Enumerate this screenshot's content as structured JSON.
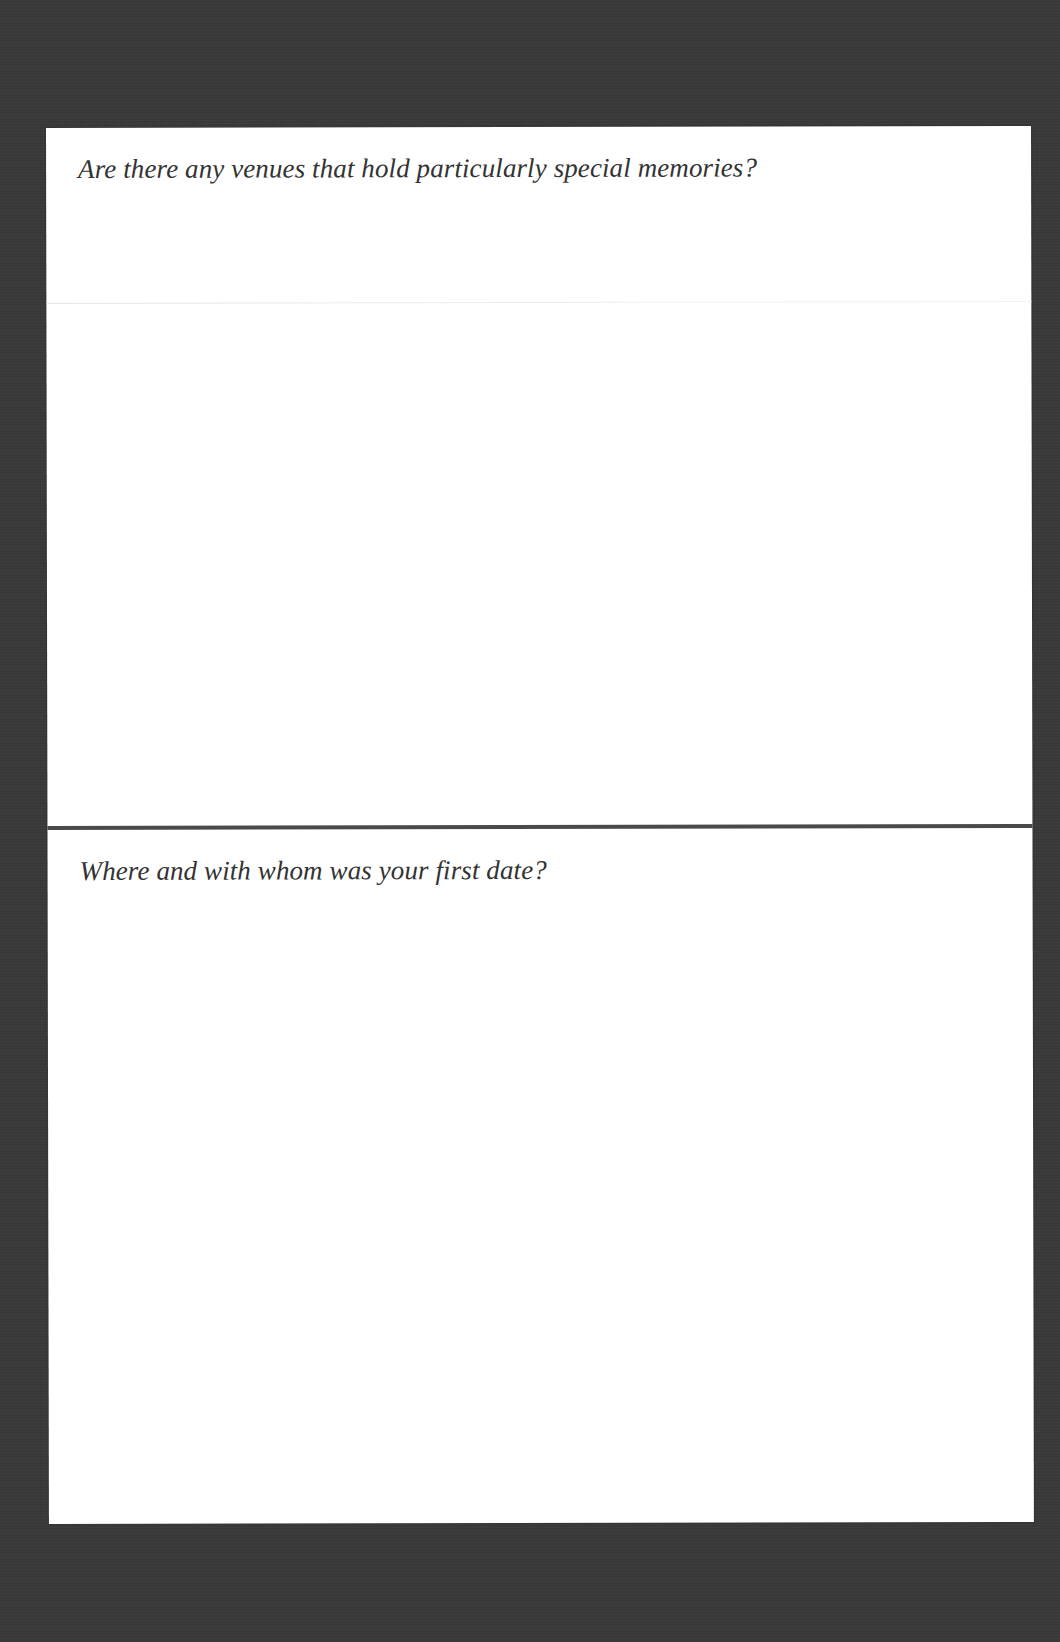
{
  "document": {
    "type": "journal page",
    "background_color": "#3a3a3a",
    "page_color": "#ffffff",
    "text_color": "#333333",
    "divider_color": "#4a4a4a"
  },
  "sections": [
    {
      "prompt": "Are there any venues that hold particularly special memories?",
      "answer": ""
    },
    {
      "prompt": "Where and with whom was your first date?",
      "answer": ""
    }
  ]
}
